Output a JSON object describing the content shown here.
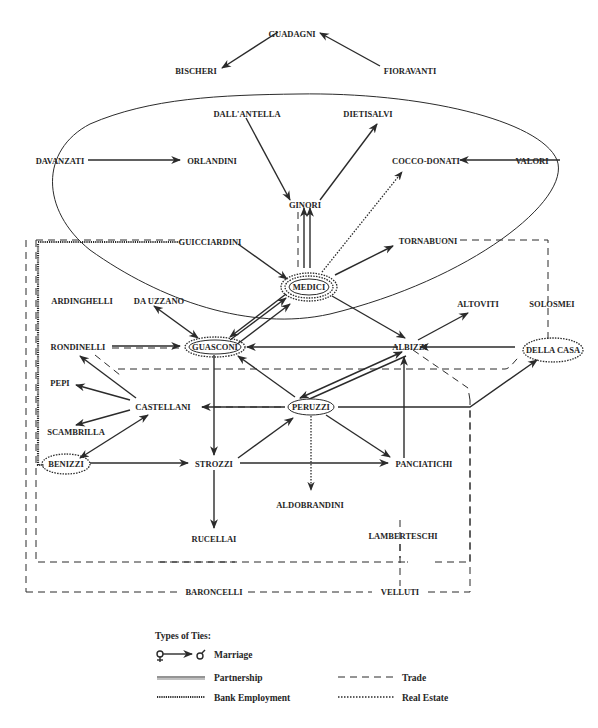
{
  "diagram": {
    "nodes": {
      "guadagni": "GUADAGNI",
      "bischeri": "BISCHERI",
      "fioravanti": "FIORAVANTI",
      "dallantella": "DALL'ANTELLA",
      "dietisalvi": "DIETISALVI",
      "davanzati": "DAVANZATI",
      "orlandini": "ORLANDINI",
      "coccodonati": "COCCO-DONATI",
      "valori": "VALORI",
      "ginori": "GINORI",
      "guicciardini": "GUICCIARDINI",
      "tornabuoni": "TORNABUONI",
      "medici": "MEDICI",
      "ardinghelli": "ARDINGHELLI",
      "dauzzano": "DA UZZANO",
      "altoviti": "ALTOVITI",
      "solosmei": "SOLOSMEI",
      "rondinelli": "RONDINELLI",
      "guasconi": "GUASCONI",
      "albizzi": "ALBIZZI",
      "dellacasa": "DELLA CASA",
      "pepi": "PEPI",
      "castellani": "CASTELLANI",
      "peruzzi": "PERUZZI",
      "scambrilla": "SCAMBRILLA",
      "benizzi": "BENIZZI",
      "strozzi": "STROZZI",
      "panciatichi": "PANCIATICHI",
      "aldobrandini": "ALDOBRANDINI",
      "rucellai": "RUCELLAI",
      "lamberteschi": "LAMBERTESCHI",
      "baroncelli": "BARONCELLI",
      "velluti": "VELLUTI"
    },
    "legend": {
      "title": "Types of Ties:",
      "marriage": "Marriage",
      "partnership": "Partnership",
      "trade": "Trade",
      "bank_employment": "Bank Employment",
      "real_estate": "Real Estate"
    },
    "colors": {
      "ink": "#2b2b2b",
      "background": "#ffffff"
    }
  }
}
